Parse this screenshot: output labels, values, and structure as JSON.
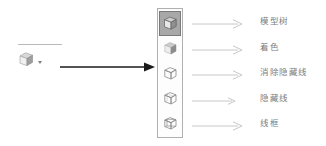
{
  "source_tool": {
    "name": "display-style-toolbar-button",
    "icon": "cube-shaded-icon",
    "dropdown_icon": "chevron-down-icon",
    "separator": "toolbar-separator"
  },
  "pointer": {
    "icon": "arrow-right-solid-icon"
  },
  "toolbar": {
    "name": "display-style-flyout-toolbar",
    "items": [
      {
        "icon": "cube-model-tree-icon",
        "selected": true,
        "label": "模型树",
        "callout_icon": "arrow-right-thin-icon"
      },
      {
        "icon": "cube-shaded-icon",
        "selected": false,
        "label": "着色",
        "callout_icon": "arrow-right-thin-icon"
      },
      {
        "icon": "cube-no-hidden-lines-icon",
        "selected": false,
        "label": "消除隐藏线",
        "callout_icon": "arrow-right-thin-icon"
      },
      {
        "icon": "cube-hidden-lines-icon",
        "selected": false,
        "label": "隐藏线",
        "callout_icon": "arrow-right-thin-icon"
      },
      {
        "icon": "cube-wireframe-icon",
        "selected": false,
        "label": "线框",
        "callout_icon": "arrow-right-thin-icon"
      }
    ]
  },
  "colors": {
    "background": "#ffffff",
    "label_text": "#7c7c7c",
    "callout_arrow": "#bdbdbd",
    "pointer_arrow": "#1a1a1a",
    "toolbar_border": "#b0b0b0",
    "selected_button_bg": "#a8a8a8",
    "icon_line": "#8a8a8a"
  }
}
